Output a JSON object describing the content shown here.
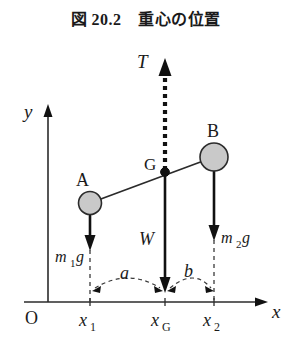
{
  "figure": {
    "title": "図 20.2　重心の位置",
    "caption_number": "20.2",
    "caption_text": "重心の位置"
  },
  "axes": {
    "origin_label": "O",
    "x_axis_label": "x",
    "y_axis_label": "y",
    "x_tick_labels": [
      "x₁",
      "xɢ",
      "x₂"
    ],
    "x_tick_label_1": "x",
    "x_tick_sub_1": "1",
    "x_tick_label_g": "x",
    "x_tick_sub_g": "G",
    "x_tick_label_2": "x",
    "x_tick_sub_2": "2"
  },
  "points": {
    "mass_a_label": "A",
    "mass_b_label": "B",
    "center_of_gravity_label": "G"
  },
  "forces": {
    "tension_label": "T",
    "weight_total_label": "W",
    "weight_a_base": "m",
    "weight_a_sub": "1",
    "weight_a_suffix": "g",
    "weight_b_base": "m",
    "weight_b_sub": "2",
    "weight_b_suffix": "g"
  },
  "dimensions": {
    "distance_left_label": "a",
    "distance_right_label": "b"
  },
  "colors": {
    "stroke": "#2b2b2b",
    "ink": "#111111",
    "mass_fill": "#c9c9c9",
    "background": "#ffffff",
    "dashed": "#3a3a3a"
  },
  "geometry": {
    "x_axis_y": 302,
    "y_axis_x": 48,
    "mass_a_x": 90,
    "mass_g_x": 165,
    "mass_b_x": 214
  }
}
